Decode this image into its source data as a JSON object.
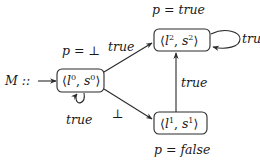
{
  "diagram": {
    "machine_label": "M ::",
    "nodes": [
      {
        "id": "n0",
        "label_l": "l",
        "label_s": "s",
        "index": "0",
        "prop_label": "p = ⊥",
        "self_loop_label": "true"
      },
      {
        "id": "n1",
        "label_l": "l",
        "label_s": "s",
        "index": "1",
        "prop_label": "p = false"
      },
      {
        "id": "n2",
        "label_l": "l",
        "label_s": "s",
        "index": "2",
        "prop_label": "p = true",
        "self_loop_label": "true"
      }
    ],
    "edges": [
      {
        "from": "start",
        "to": "n0",
        "label": ""
      },
      {
        "from": "n0",
        "to": "n0",
        "label": "true"
      },
      {
        "from": "n0",
        "to": "n2",
        "label": "true"
      },
      {
        "from": "n0",
        "to": "n1",
        "label": "⊥"
      },
      {
        "from": "n1",
        "to": "n2",
        "label": "true"
      },
      {
        "from": "n2",
        "to": "n2",
        "label": "true"
      }
    ],
    "edge_labels": {
      "n0_n2": "true",
      "n0_n1": "⊥",
      "n1_n2": "true",
      "n0_self": "true",
      "n2_self": "true"
    },
    "colors": {
      "stroke": "#2a2a2a",
      "text": "#1a1a1a",
      "background": "#ffffff"
    }
  }
}
